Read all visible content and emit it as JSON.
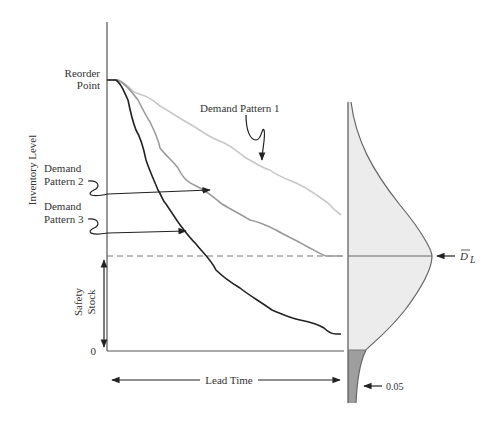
{
  "diagram": {
    "labels": {
      "reorder_point_line1": "Reorder",
      "reorder_point_line2": "Point",
      "y_axis": "Inventory Level",
      "demand_pattern_1": "Demand Pattern 1",
      "demand_pattern_2_line1": "Demand",
      "demand_pattern_2_line2": "Pattern 2",
      "demand_pattern_3_line1": "Demand",
      "demand_pattern_3_line2": "Pattern 3",
      "safety_stock_line1": "Safety",
      "safety_stock_line2": "Stock",
      "zero": "0",
      "lead_time": "Lead Time",
      "mean_demand": "D",
      "mean_demand_subscript": "L",
      "stockout_probability": "0.05"
    },
    "colors": {
      "pattern_1": "#c8c8c8",
      "pattern_2": "#9a9a9a",
      "pattern_3": "#222222",
      "distribution_fill": "#ececec",
      "tail_fill": "#9e9e9e",
      "axis": "#555555"
    }
  }
}
